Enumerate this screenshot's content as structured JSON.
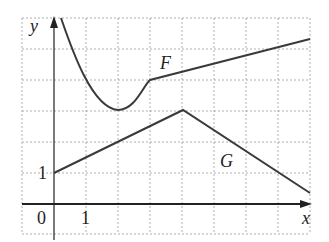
{
  "figure": {
    "axes": {
      "x_label": "x",
      "y_label": "y",
      "origin_label": "0",
      "x_tick_label": "1",
      "y_tick_label": "1"
    },
    "curves": [
      {
        "name": "F",
        "label": "F"
      },
      {
        "name": "G",
        "label": "G"
      }
    ],
    "colors": {
      "curve": "#3a3a3a",
      "grid": "#9a9a9a",
      "axis": "#222222"
    }
  }
}
